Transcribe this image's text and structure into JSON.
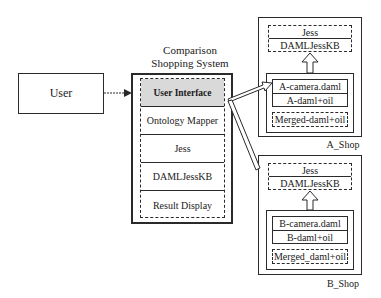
{
  "user": {
    "label": "User"
  },
  "system": {
    "title_line1": "Comparison",
    "title_line2": "Shopping  System",
    "modules": [
      {
        "label": "User Interface",
        "highlight": true
      },
      {
        "label": "Ontology  Mapper"
      },
      {
        "label": "Jess"
      },
      {
        "label": "DAMLJessKB"
      },
      {
        "label": "Result  Display"
      }
    ]
  },
  "shops": [
    {
      "name": "A_Shop",
      "engine": [
        "Jess",
        "DAMLJessKB"
      ],
      "ontology": [
        "A-camera.daml",
        "A-daml+oil"
      ],
      "merged": "Merged-daml+oil"
    },
    {
      "name": "B_Shop",
      "engine": [
        "Jess",
        "DAMLJessKB"
      ],
      "ontology": [
        "B-camera.daml",
        "B-daml+oil"
      ],
      "merged": "Merged_daml+oil"
    }
  ],
  "colors": {
    "highlight": "#d9d9d9",
    "line": "#2a2a2a"
  }
}
